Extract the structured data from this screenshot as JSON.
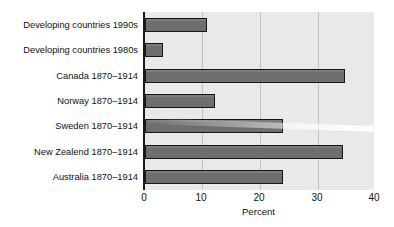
{
  "chart_data": {
    "type": "bar",
    "orientation": "horizontal",
    "title": "",
    "xlabel": "Percent",
    "ylabel": "",
    "xlim": [
      0,
      40
    ],
    "xticks": [
      0,
      10,
      20,
      30,
      40
    ],
    "xtick_labels": [
      "0",
      "10",
      "20",
      "30",
      "40"
    ],
    "grid": "vertical",
    "legend": "none",
    "categories": [
      "Developing countries 1990s",
      "Developing countries 1980s",
      "Canada 1870–1914",
      "Norway 1870–1914",
      "Sweden 1870–1914",
      "New Zealend 1870–1914",
      "Australia 1870–1914"
    ],
    "values": [
      10.8,
      3.2,
      35.0,
      12.2,
      24.1,
      34.5,
      24.1
    ],
    "bar_color": "#6e6e6e",
    "bar_edge_color": "#161616",
    "plot_background": "#e9e9e9",
    "grid_color": "#c2c2c2",
    "axis_color": "#1a1a1a"
  }
}
